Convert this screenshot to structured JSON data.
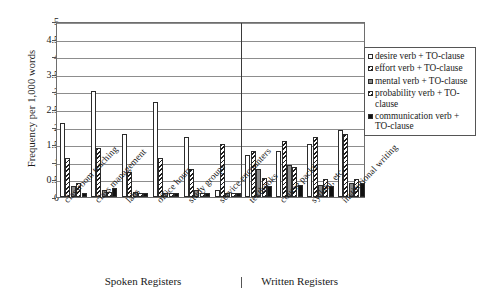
{
  "chart_data": {
    "type": "bar",
    "title": "",
    "xlabel": "",
    "ylabel": "Frequency per 1,000 words",
    "ylim": [
      0,
      5
    ],
    "ytick_labels": [
      "0",
      "0.5",
      "1",
      "1.5",
      "2",
      "2.5",
      "3",
      "3.5",
      "4",
      "4.5",
      "5"
    ],
    "ytick_values": [
      0,
      0.5,
      1,
      1.5,
      2,
      2.5,
      3,
      3.5,
      4,
      4.5,
      5
    ],
    "grid": true,
    "legend_position": "right",
    "categories": [
      "classroom teaching",
      "class management",
      "labs",
      "office hours",
      "study groups",
      "service encounters",
      "textbooks",
      "course packs",
      "syllabi, etc.",
      "institutional writing"
    ],
    "series": [
      {
        "name": "desire verb + TO-clause",
        "pattern": "white",
        "values": [
          2.1,
          3.0,
          1.8,
          2.7,
          1.7,
          0.2,
          1.2,
          1.3,
          1.5,
          1.9
        ]
      },
      {
        "name": "effort verb + TO-clause",
        "pattern": "diagonal-hatch",
        "values": [
          1.1,
          1.4,
          0.7,
          1.1,
          0.8,
          1.5,
          1.3,
          1.6,
          1.7,
          1.8
        ]
      },
      {
        "name": "mental verb + TO-clause",
        "pattern": "gray",
        "values": [
          0.3,
          0.2,
          0.15,
          0.1,
          0.2,
          0.1,
          0.8,
          0.9,
          0.35,
          0.4
        ]
      },
      {
        "name": "probability verb + TO-clause",
        "pattern": "diagonal-hatch",
        "values": [
          0.4,
          0.15,
          0.1,
          0.1,
          0.1,
          0.1,
          0.55,
          0.85,
          0.5,
          0.5
        ]
      },
      {
        "name": "communication verb + TO-clause",
        "pattern": "black",
        "values": [
          0.1,
          0.25,
          0.1,
          0.1,
          0.1,
          0.1,
          0.3,
          0.35,
          0.3,
          0.4
        ]
      }
    ],
    "register_divider_after_category": "service encounters",
    "register_groups": [
      {
        "label": "Spoken Registers"
      },
      {
        "label": "Written Registers"
      }
    ]
  },
  "legend": {
    "items": [
      {
        "label": "desire verb + TO-clause"
      },
      {
        "label": "effort verb + TO-clause"
      },
      {
        "label": "mental verb + TO-clause"
      },
      {
        "label": "probability verb + TO-clause"
      },
      {
        "label": "communication verb + TO-clause"
      }
    ]
  }
}
